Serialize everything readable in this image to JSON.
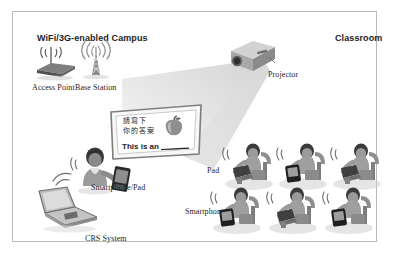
{
  "diagram": {
    "background_color": "#ffffff",
    "frame_color": "#b9b9b9",
    "zones": [
      {
        "id": "campus",
        "label": "WiFi/3G-enabled Campus"
      },
      {
        "id": "classroom",
        "label": "Classroom"
      }
    ],
    "labels": {
      "campus": "WiFi/3G-enabled Campus",
      "classroom": "Classroom",
      "access_point": "Access Point",
      "base_station": "Base Station",
      "projector": "Projector",
      "smartphone_pad": "Smartphone/Pad",
      "crs_system": "CRS System",
      "pad": "Pad",
      "smartphone": "Smartphone"
    },
    "board": {
      "line_cn_1": "請寫下",
      "line_cn_2": "你的答案",
      "line_en": "This is an ____.",
      "illustration": "apple-image"
    },
    "icons": {
      "access_point": "wireless-router-icon",
      "base_station": "cell-tower-icon",
      "projector": "projector-icon",
      "laptop": "laptop-icon",
      "teacher": "teacher-figure-icon",
      "handheld": "smartphone-icon",
      "signal": "wifi-signal-icon"
    },
    "students": {
      "rows": 2,
      "columns": 3,
      "count": 6,
      "devices": [
        {
          "row": 1,
          "col": 1,
          "device": "pad"
        },
        {
          "row": 1,
          "col": 2,
          "device": "smartphone"
        },
        {
          "row": 1,
          "col": 3,
          "device": "pad"
        },
        {
          "row": 2,
          "col": 1,
          "device": "smartphone"
        },
        {
          "row": 2,
          "col": 2,
          "device": "pad"
        },
        {
          "row": 2,
          "col": 3,
          "device": "smartphone"
        }
      ]
    },
    "colors": {
      "text": "#1d1d1d",
      "frame": "#b9b9b9",
      "beam": "#d8d8d8",
      "device_dark": "#3a3a3a",
      "figure_gray": "#8d8d8d"
    }
  }
}
